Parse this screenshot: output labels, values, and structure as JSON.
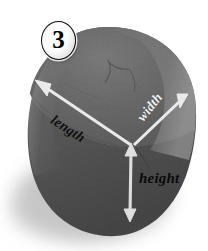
{
  "figure": {
    "type": "labeled-photo-diagram",
    "background_color": "#ffffff",
    "badge": {
      "label": "3",
      "shape": "ellipse",
      "fill_color": "#fdfdfd",
      "outline_color": "#111111",
      "text_color": "#000000"
    },
    "object": {
      "name": "rock",
      "top_face_color": "#6b6b6b",
      "front_face_color": "#575757",
      "highlight_color": "#7e7e7e",
      "shadow_color": "#b9b9b9"
    },
    "dimensions": [
      {
        "id": "length",
        "label": "length",
        "text_color": "#0d0d0d",
        "arrow_color": "#e8e8e8",
        "rotation_deg": 33,
        "arrowhead": "start",
        "from": {
          "x": 37,
          "y": 82
        },
        "to": {
          "x": 131,
          "y": 145
        }
      },
      {
        "id": "width",
        "label": "width",
        "text_color": "#f2f2f2",
        "arrow_color": "#e8e8e8",
        "rotation_deg": -52,
        "arrowhead": "start",
        "from": {
          "x": 187,
          "y": 96
        },
        "to": {
          "x": 134,
          "y": 145
        }
      },
      {
        "id": "height",
        "label": "height",
        "text_color": "#0a0a0a",
        "arrow_color": "#e0e0e0",
        "rotation_deg": 0,
        "arrowhead": "both",
        "from": {
          "x": 131,
          "y": 148
        },
        "to": {
          "x": 130,
          "y": 221
        }
      }
    ]
  }
}
